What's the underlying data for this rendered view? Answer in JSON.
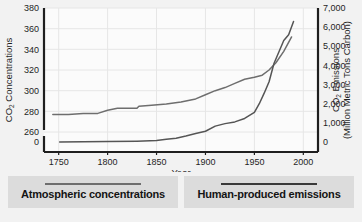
{
  "chart_data": {
    "type": "line",
    "title": "",
    "xlabel": "Year",
    "ylabel_left": "CO  Concentrations",
    "ylabel_left_sub": "2",
    "ylabel_right_line1": "CO  Emissions",
    "ylabel_right_sub": "2",
    "ylabel_right_line2": "(Million Metric Tons Carbon)",
    "grid": true,
    "legend_position": "bottom",
    "xlim": [
      1735,
      2015
    ],
    "xticks": [
      1750,
      1800,
      1850,
      1900,
      1950,
      2000
    ],
    "xtick_labels": [
      "1750",
      "1800",
      "1850",
      "1900",
      "1950",
      "2000"
    ],
    "left_axis": {
      "ticks": [
        380,
        360,
        340,
        320,
        300,
        280,
        260,
        0
      ],
      "tick_labels": [
        "380",
        "360",
        "340",
        "320",
        "300",
        "280",
        "260",
        "0"
      ],
      "axis_break_between": [
        260,
        0
      ],
      "units": "ppm"
    },
    "right_axis": {
      "ticks": [
        7000,
        6000,
        5000,
        4000,
        3000,
        2000,
        1000,
        0
      ],
      "tick_labels": [
        "7,000",
        "6,000",
        "5,000",
        "4,000",
        "3,000",
        "2,000",
        "1,000",
        "0"
      ],
      "units": "Million Metric Tons Carbon"
    },
    "series": [
      {
        "name": "Atmospheric concentrations",
        "axis": "left",
        "color": "#6e6e6e",
        "x": [
          1744,
          1760,
          1775,
          1790,
          1800,
          1810,
          1820,
          1830,
          1832,
          1845,
          1860,
          1875,
          1890,
          1900,
          1910,
          1920,
          1930,
          1940,
          1950,
          1958,
          1965,
          1972,
          1980,
          1988
        ],
        "values": [
          277,
          277,
          278,
          278,
          281,
          283,
          283,
          283,
          285,
          286,
          287,
          289,
          292,
          296,
          300,
          303,
          307,
          311,
          313,
          315,
          320,
          327,
          338,
          352
        ]
      },
      {
        "name": "Human-produced emissions",
        "axis": "right",
        "color": "#555555",
        "x": [
          1751,
          1800,
          1830,
          1850,
          1860,
          1870,
          1880,
          1890,
          1900,
          1910,
          1920,
          1930,
          1940,
          1950,
          1955,
          1960,
          1965,
          1970,
          1975,
          1980,
          1985,
          1990
        ],
        "values": [
          5,
          20,
          45,
          80,
          140,
          200,
          310,
          440,
          560,
          830,
          960,
          1050,
          1230,
          1550,
          2000,
          2550,
          3150,
          4100,
          4700,
          5300,
          5600,
          6300
        ]
      }
    ]
  },
  "legend": {
    "items": [
      {
        "label": "Atmospheric concentrations",
        "color": "#6e6e6e"
      },
      {
        "label": "Human-produced emissions",
        "color": "#3a3a3a"
      }
    ]
  },
  "caption": ""
}
